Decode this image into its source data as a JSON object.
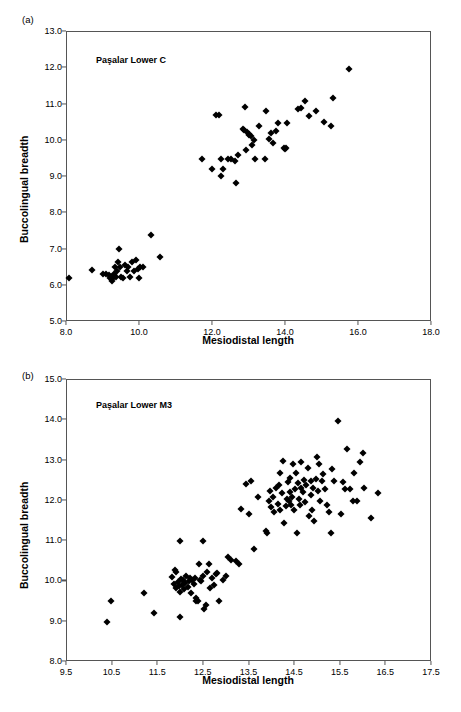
{
  "figure": {
    "panels": [
      {
        "key": "a",
        "panel_label": "(a)",
        "title": "Paşalar Lower C"
      },
      {
        "key": "b",
        "panel_label": "(b)",
        "title": "Paşalar Lower M3"
      }
    ],
    "marker_color": "#000000",
    "axis_color": "#555555"
  },
  "chart_data": [
    {
      "type": "scatter",
      "title": "Paşalar Lower C",
      "panel_label": "(a)",
      "xlabel": "Mesiodistal length",
      "ylabel": "Buccolingual breadth",
      "xlim": [
        8.0,
        18.0
      ],
      "ylim": [
        5.0,
        13.0
      ],
      "xticks": [
        "8.0",
        "10.0",
        "12.0",
        "14.0",
        "16.0",
        "18.0"
      ],
      "xtick_values": [
        8.0,
        10.0,
        12.0,
        14.0,
        16.0,
        18.0
      ],
      "yticks": [
        "5.0",
        "6.0",
        "7.0",
        "8.0",
        "9.0",
        "10.0",
        "11.0",
        "12.0",
        "13.0"
      ],
      "ytick_values": [
        5.0,
        6.0,
        7.0,
        8.0,
        9.0,
        10.0,
        11.0,
        12.0,
        13.0
      ],
      "grid": false,
      "legend": null,
      "series": [
        {
          "name": "Lower C",
          "marker": "diamond",
          "points": [
            [
              8.08,
              6.2
            ],
            [
              8.7,
              6.42
            ],
            [
              9.02,
              6.3
            ],
            [
              9.1,
              6.3
            ],
            [
              9.18,
              6.28
            ],
            [
              9.2,
              6.18
            ],
            [
              9.24,
              6.22
            ],
            [
              9.26,
              6.1
            ],
            [
              9.3,
              6.18
            ],
            [
              9.32,
              6.3
            ],
            [
              9.34,
              6.48
            ],
            [
              9.36,
              6.22
            ],
            [
              9.4,
              6.38
            ],
            [
              9.42,
              6.62
            ],
            [
              9.44,
              7.0
            ],
            [
              9.48,
              6.5
            ],
            [
              9.5,
              6.22
            ],
            [
              9.56,
              6.18
            ],
            [
              9.62,
              6.55
            ],
            [
              9.66,
              6.38
            ],
            [
              9.7,
              6.48
            ],
            [
              9.74,
              6.22
            ],
            [
              9.8,
              6.62
            ],
            [
              9.86,
              6.38
            ],
            [
              9.92,
              6.68
            ],
            [
              9.96,
              6.44
            ],
            [
              10.0,
              6.18
            ],
            [
              10.04,
              6.48
            ],
            [
              10.12,
              6.5
            ],
            [
              10.34,
              7.38
            ],
            [
              10.58,
              6.76
            ],
            [
              11.72,
              9.48
            ],
            [
              12.0,
              9.18
            ],
            [
              12.12,
              10.68
            ],
            [
              12.2,
              10.68
            ],
            [
              12.24,
              9.0
            ],
            [
              12.26,
              9.48
            ],
            [
              12.3,
              9.18
            ],
            [
              12.44,
              9.48
            ],
            [
              12.52,
              9.46
            ],
            [
              12.62,
              9.42
            ],
            [
              12.66,
              8.8
            ],
            [
              12.72,
              9.58
            ],
            [
              12.86,
              10.3
            ],
            [
              12.88,
              10.26
            ],
            [
              12.9,
              10.9
            ],
            [
              12.92,
              9.72
            ],
            [
              12.96,
              10.22
            ],
            [
              13.0,
              10.12
            ],
            [
              13.02,
              10.16
            ],
            [
              13.06,
              10.1
            ],
            [
              13.1,
              9.86
            ],
            [
              13.14,
              10.0
            ],
            [
              13.18,
              9.46
            ],
            [
              13.3,
              10.38
            ],
            [
              13.44,
              9.46
            ],
            [
              13.48,
              10.8
            ],
            [
              13.56,
              10.02
            ],
            [
              13.62,
              10.18
            ],
            [
              13.66,
              9.9
            ],
            [
              13.74,
              10.24
            ],
            [
              13.82,
              10.46
            ],
            [
              13.96,
              9.76
            ],
            [
              14.0,
              9.74
            ],
            [
              14.02,
              9.76
            ],
            [
              14.06,
              10.46
            ],
            [
              14.36,
              10.86
            ],
            [
              14.44,
              10.88
            ],
            [
              14.56,
              11.06
            ],
            [
              14.66,
              10.66
            ],
            [
              14.84,
              10.78
            ],
            [
              15.06,
              10.48
            ],
            [
              15.26,
              10.38
            ],
            [
              15.32,
              11.14
            ],
            [
              15.74,
              11.96
            ]
          ]
        }
      ]
    },
    {
      "type": "scatter",
      "title": "Paşalar Lower M3",
      "panel_label": "(b)",
      "xlabel": "Mesiodistal length",
      "ylabel": "Buccolingual breadth",
      "xlim": [
        9.5,
        17.5
      ],
      "ylim": [
        8.0,
        15.0
      ],
      "xticks": [
        "9.5",
        "10.5",
        "11.5",
        "12.5",
        "13.5",
        "14.5",
        "15.5",
        "16.5",
        "17.5"
      ],
      "xtick_values": [
        9.5,
        10.5,
        11.5,
        12.5,
        13.5,
        14.5,
        15.5,
        16.5,
        17.5
      ],
      "yticks": [
        "8.0",
        "9.0",
        "10.0",
        "11.0",
        "12.0",
        "13.0",
        "14.0",
        "15.0"
      ],
      "ytick_values": [
        8.0,
        9.0,
        10.0,
        11.0,
        12.0,
        13.0,
        14.0,
        15.0
      ],
      "grid": false,
      "legend": null,
      "series": [
        {
          "name": "Lower M3",
          "marker": "diamond",
          "points": [
            [
              10.4,
              8.98
            ],
            [
              10.48,
              9.48
            ],
            [
              11.2,
              9.68
            ],
            [
              11.42,
              9.19
            ],
            [
              12.0,
              9.08
            ],
            [
              12.0,
              10.98
            ],
            [
              12.5,
              10.98
            ],
            [
              11.82,
              10.08
            ],
            [
              11.88,
              10.26
            ],
            [
              11.92,
              10.2
            ],
            [
              11.86,
              9.9
            ],
            [
              11.9,
              9.8
            ],
            [
              11.96,
              9.96
            ],
            [
              11.98,
              9.86
            ],
            [
              12.0,
              9.72
            ],
            [
              12.02,
              10.04
            ],
            [
              12.04,
              9.88
            ],
            [
              12.06,
              10.0
            ],
            [
              12.08,
              9.78
            ],
            [
              12.1,
              9.94
            ],
            [
              12.14,
              10.1
            ],
            [
              12.18,
              9.84
            ],
            [
              12.2,
              9.98
            ],
            [
              12.22,
              10.06
            ],
            [
              12.24,
              9.7
            ],
            [
              12.26,
              10.0
            ],
            [
              12.3,
              9.9
            ],
            [
              12.32,
              10.06
            ],
            [
              12.34,
              9.56
            ],
            [
              12.36,
              9.48
            ],
            [
              12.4,
              9.5
            ],
            [
              12.42,
              10.4
            ],
            [
              12.44,
              10.02
            ],
            [
              12.46,
              9.98
            ],
            [
              12.5,
              10.1
            ],
            [
              12.52,
              9.3
            ],
            [
              12.56,
              9.38
            ],
            [
              12.6,
              10.22
            ],
            [
              12.64,
              10.4
            ],
            [
              12.66,
              9.8
            ],
            [
              12.7,
              10.06
            ],
            [
              12.74,
              9.88
            ],
            [
              12.78,
              10.16
            ],
            [
              12.82,
              10.18
            ],
            [
              12.86,
              9.48
            ],
            [
              12.94,
              10.02
            ],
            [
              13.0,
              10.12
            ],
            [
              13.06,
              10.58
            ],
            [
              13.12,
              10.5
            ],
            [
              13.22,
              10.48
            ],
            [
              13.3,
              10.4
            ],
            [
              13.34,
              11.78
            ],
            [
              13.44,
              12.4
            ],
            [
              13.5,
              11.66
            ],
            [
              13.56,
              12.46
            ],
            [
              13.62,
              10.78
            ],
            [
              13.7,
              12.08
            ],
            [
              13.88,
              11.22
            ],
            [
              13.9,
              11.18
            ],
            [
              13.94,
              11.98
            ],
            [
              13.98,
              12.22
            ],
            [
              14.0,
              11.82
            ],
            [
              14.04,
              12.08
            ],
            [
              14.06,
              11.7
            ],
            [
              14.1,
              12.3
            ],
            [
              14.14,
              11.9
            ],
            [
              14.16,
              12.36
            ],
            [
              14.18,
              12.66
            ],
            [
              14.2,
              11.76
            ],
            [
              14.24,
              12.18
            ],
            [
              14.26,
              12.96
            ],
            [
              14.28,
              11.42
            ],
            [
              14.32,
              11.84
            ],
            [
              14.34,
              12.02
            ],
            [
              14.36,
              12.44
            ],
            [
              14.38,
              11.96
            ],
            [
              14.4,
              12.2
            ],
            [
              14.42,
              12.54
            ],
            [
              14.44,
              11.86
            ],
            [
              14.46,
              12.06
            ],
            [
              14.48,
              12.9
            ],
            [
              14.5,
              11.74
            ],
            [
              14.52,
              12.26
            ],
            [
              14.54,
              12.66
            ],
            [
              14.56,
              11.18
            ],
            [
              14.58,
              12.42
            ],
            [
              14.6,
              12.02
            ],
            [
              14.62,
              11.88
            ],
            [
              14.64,
              12.3
            ],
            [
              14.66,
              12.94
            ],
            [
              14.7,
              12.2
            ],
            [
              14.72,
              12.5
            ],
            [
              14.74,
              11.94
            ],
            [
              14.76,
              12.36
            ],
            [
              14.8,
              12.78
            ],
            [
              14.82,
              11.6
            ],
            [
              14.86,
              12.12
            ],
            [
              14.88,
              12.48
            ],
            [
              14.9,
              11.76
            ],
            [
              14.92,
              12.3
            ],
            [
              14.94,
              11.48
            ],
            [
              14.98,
              12.52
            ],
            [
              15.0,
              13.06
            ],
            [
              15.02,
              12.22
            ],
            [
              15.04,
              12.9
            ],
            [
              15.06,
              11.98
            ],
            [
              15.1,
              12.46
            ],
            [
              15.14,
              12.64
            ],
            [
              15.18,
              12.26
            ],
            [
              15.22,
              11.86
            ],
            [
              15.26,
              11.7
            ],
            [
              15.3,
              11.18
            ],
            [
              15.34,
              12.76
            ],
            [
              15.38,
              12.48
            ],
            [
              15.46,
              13.96
            ],
            [
              15.52,
              11.66
            ],
            [
              15.58,
              12.44
            ],
            [
              15.62,
              12.26
            ],
            [
              15.66,
              13.26
            ],
            [
              15.72,
              12.28
            ],
            [
              15.78,
              11.98
            ],
            [
              15.82,
              12.66
            ],
            [
              15.88,
              11.96
            ],
            [
              15.94,
              12.94
            ],
            [
              16.0,
              13.16
            ],
            [
              16.04,
              12.3
            ],
            [
              16.18,
              11.54
            ],
            [
              16.34,
              12.16
            ]
          ]
        }
      ]
    }
  ]
}
